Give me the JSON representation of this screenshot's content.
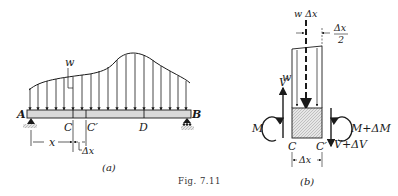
{
  "figure": {
    "caption": "Fig. 7.11",
    "panel_a": {
      "sublabel": "(a)",
      "load_label": "w",
      "support_left_label": "A",
      "support_right_label": "B",
      "point_c_label": "C",
      "point_c_prime_label": "C′",
      "point_d_label": "D",
      "dim_x_label": "x",
      "dim_dx_label": "Δx"
    },
    "panel_b": {
      "sublabel": "(b)",
      "resultant_label": "w Δx",
      "half_dx_num": "Δx",
      "half_dx_den": "2",
      "load_label": "w",
      "shear_left_label": "V",
      "moment_left_label": "M",
      "moment_right_label": "M+ΔM",
      "shear_right_label": "V+ΔV",
      "point_c_label": "C",
      "point_c_prime_label": "C′",
      "dim_dx_label": "Δx"
    }
  },
  "colors": {
    "ink": "#1a1a1a",
    "beam_fill": "#d9d9d9",
    "hatch_fill": "#cfcfcf"
  }
}
